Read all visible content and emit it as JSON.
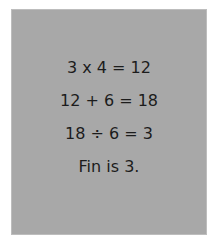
{
  "card": {
    "background_color": "#a8a8a8",
    "text_color": "#1c1c1c",
    "lines": [
      "3 x 4 = 12",
      "12 + 6 = 18",
      "18 ÷ 6 = 3",
      "Fin is 3."
    ]
  }
}
